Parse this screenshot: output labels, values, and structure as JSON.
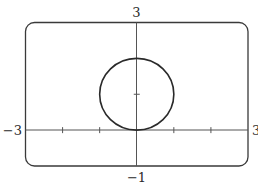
{
  "chart_data": {
    "type": "line",
    "title": "",
    "xlabel": "",
    "ylabel": "",
    "xlim": [
      -3,
      3
    ],
    "ylim": [
      -1,
      3
    ],
    "grid": false,
    "legend": null,
    "x_ticks": [
      -2,
      -1,
      1,
      2
    ],
    "y_ticks": [
      1
    ],
    "tick_labels": {
      "xmin": "−3",
      "xmax": "3",
      "ymin": "−1",
      "ymax": "3"
    },
    "series": [
      {
        "name": "circle",
        "equation": "x^2 + (y-1)^2 = 1",
        "shape": "circle",
        "center": [
          0,
          1
        ],
        "radius": 1,
        "color": "#2a2a2a"
      }
    ]
  },
  "labels": {
    "xmin": "−3",
    "xmax": "3",
    "ymin": "−1",
    "ymax": "3"
  },
  "colors": {
    "frame": "#3a3a3a",
    "axes": "#555555",
    "curve": "#2a2a2a"
  }
}
